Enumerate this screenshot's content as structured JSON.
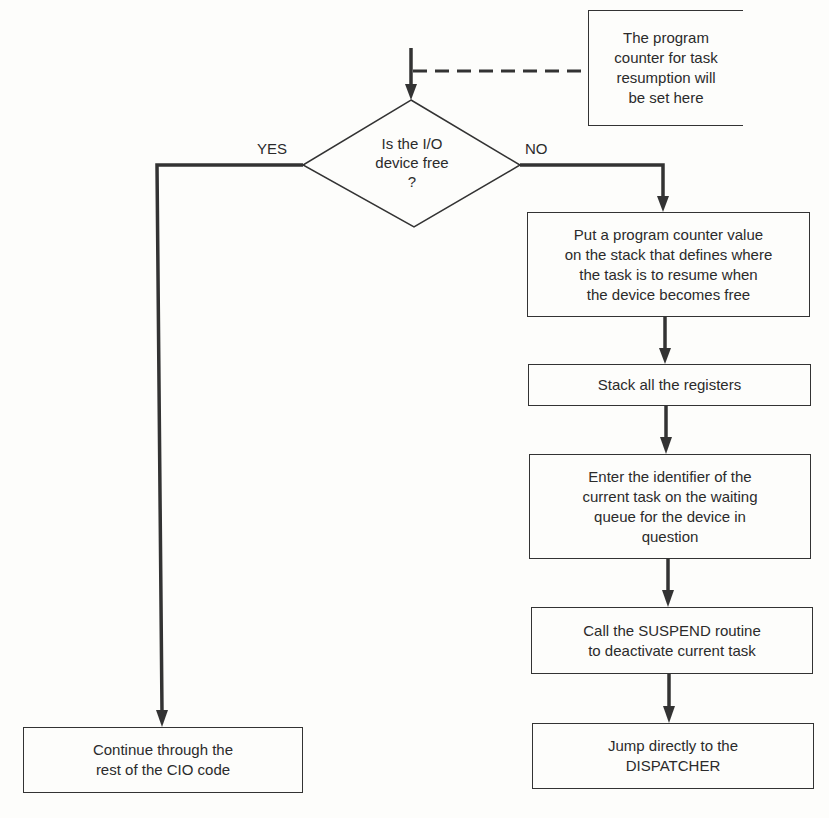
{
  "diagram": {
    "type": "flowchart",
    "colors": {
      "line": "#333333",
      "text": "#2b2b2b",
      "background": "#fdfdfb"
    },
    "annotation": {
      "text": "The program\ncounter for task\nresumption will\nbe set here",
      "connector": "dashed"
    },
    "decision": {
      "text": "Is the I/O\ndevice free\n?",
      "yes_label": "YES",
      "no_label": "NO"
    },
    "no_branch_steps": [
      {
        "id": "push-pc",
        "text": "Put a program counter value\non the stack that defines where\nthe task is to resume when\nthe device becomes free"
      },
      {
        "id": "stack-registers",
        "text": "Stack all the registers"
      },
      {
        "id": "enter-identifier",
        "text": "Enter the identifier of the\ncurrent task on the waiting\nqueue for the device in\nquestion"
      },
      {
        "id": "call-suspend",
        "text": "Call the SUSPEND routine\nto deactivate current task"
      },
      {
        "id": "jump-dispatcher",
        "text": "Jump directly to the\nDISPATCHER"
      }
    ],
    "yes_branch_steps": [
      {
        "id": "continue-cio",
        "text": "Continue through the\nrest of the CIO code"
      }
    ]
  }
}
